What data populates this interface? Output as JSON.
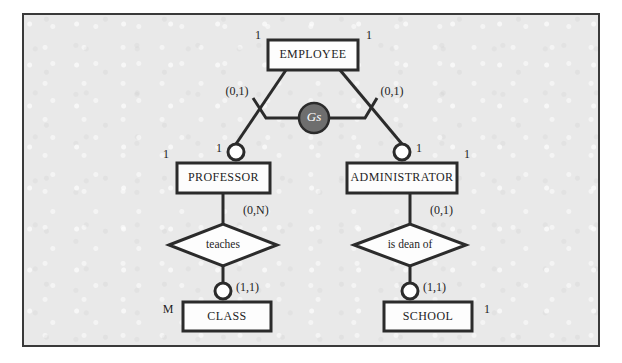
{
  "diagram": {
    "kind": "er-diagram",
    "panel": {
      "background_color": "#e9e9e9",
      "border_color": "#3a3a3a"
    },
    "entities": [
      {
        "id": "employee",
        "label": "EMPLOYEE",
        "x": 268,
        "y": 40,
        "w": 90,
        "h": 30
      },
      {
        "id": "professor",
        "label": "PROFESSOR",
        "x": 177,
        "y": 163,
        "w": 93,
        "h": 30
      },
      {
        "id": "administrator",
        "label": "ADMINISTRATOR",
        "x": 347,
        "y": 163,
        "w": 110,
        "h": 30
      },
      {
        "id": "class",
        "label": "CLASS",
        "x": 183,
        "y": 302,
        "w": 88,
        "h": 29
      },
      {
        "id": "school",
        "label": "SCHOOL",
        "x": 384,
        "y": 302,
        "w": 88,
        "h": 29
      }
    ],
    "relationships": [
      {
        "id": "teaches",
        "label": "teaches",
        "cx": 223,
        "cy": 245,
        "rx": 54,
        "ry": 21
      },
      {
        "id": "is-dean-of",
        "label": "is dean of",
        "cx": 410,
        "cy": 245,
        "rx": 56,
        "ry": 21
      }
    ],
    "generalization": {
      "id": "gs",
      "label": "Gs",
      "cx": 314,
      "cy": 118,
      "r": 15,
      "fill_color": "#6e6e6e",
      "text_color": "#ffffff"
    },
    "connectors": [
      {
        "id": "professor-top",
        "cx": 236,
        "cy": 152,
        "r": 8
      },
      {
        "id": "administrator-top",
        "cx": 402,
        "cy": 152,
        "r": 8
      },
      {
        "id": "class-top",
        "cx": 223,
        "cy": 291,
        "r": 8
      },
      {
        "id": "school-top",
        "cx": 410,
        "cy": 291,
        "r": 8
      }
    ],
    "cardinalities": [
      {
        "id": "employee-left",
        "text": "1",
        "x": 258,
        "y": 36,
        "anchor": "mid"
      },
      {
        "id": "employee-right",
        "text": "1",
        "x": 369,
        "y": 36,
        "anchor": "mid"
      },
      {
        "id": "employee-professor",
        "text": "(0,1)",
        "x": 237,
        "y": 92,
        "anchor": "mid"
      },
      {
        "id": "employee-admin",
        "text": "(0,1)",
        "x": 392,
        "y": 92,
        "anchor": "mid"
      },
      {
        "id": "professor-conn",
        "text": "1",
        "x": 219,
        "y": 149,
        "anchor": "mid"
      },
      {
        "id": "professor-left",
        "text": "1",
        "x": 166,
        "y": 155,
        "anchor": "mid"
      },
      {
        "id": "admin-conn",
        "text": "1",
        "x": 419,
        "y": 149,
        "anchor": "mid"
      },
      {
        "id": "admin-right",
        "text": "1",
        "x": 467,
        "y": 155,
        "anchor": "mid"
      },
      {
        "id": "professor-teaches",
        "text": "(0,N)",
        "x": 243,
        "y": 211,
        "anchor": "start"
      },
      {
        "id": "admin-isdeanof",
        "text": "(0,1)",
        "x": 430,
        "y": 211,
        "anchor": "start"
      },
      {
        "id": "teaches-class",
        "text": "(1,1)",
        "x": 236,
        "y": 288,
        "anchor": "start"
      },
      {
        "id": "isdeanof-school",
        "text": "(1,1)",
        "x": 423,
        "y": 288,
        "anchor": "start"
      },
      {
        "id": "class-left",
        "text": "M",
        "x": 168,
        "y": 310,
        "anchor": "mid"
      },
      {
        "id": "school-right",
        "text": "1",
        "x": 487,
        "y": 310,
        "anchor": "mid"
      }
    ],
    "edges": [
      {
        "id": "employee-to-professor",
        "points": "286,70 236,144"
      },
      {
        "id": "employee-to-admin",
        "points": "340,70 402,144"
      },
      {
        "id": "gs-stub-left",
        "points": "299,118 266,118 253,98"
      },
      {
        "id": "gs-stub-right",
        "points": "329,118 365,118 377,98"
      },
      {
        "id": "professor-to-teaches",
        "points": "223,193 223,224"
      },
      {
        "id": "teaches-to-class",
        "points": "223,266 223,283"
      },
      {
        "id": "admin-to-isdeanof",
        "points": "410,193 410,224"
      },
      {
        "id": "isdeanof-to-school",
        "points": "410,266 410,283"
      }
    ]
  }
}
